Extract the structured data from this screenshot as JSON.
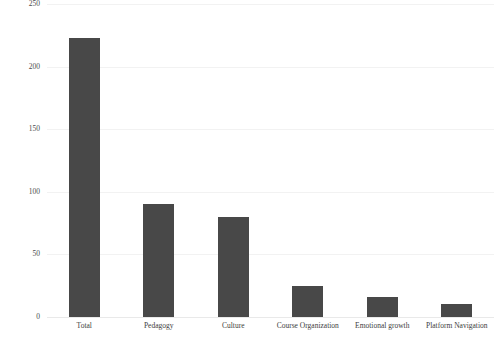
{
  "chart_data": {
    "type": "bar",
    "title": "",
    "subtitle": "",
    "xlabel": "",
    "ylabel": "",
    "categories": [
      "Total",
      "Pedagogy",
      "Culture",
      "Course Organization",
      "Emotional growth",
      "Platform Navigation"
    ],
    "values": [
      223,
      90,
      80,
      25,
      16,
      10
    ],
    "ylim": [
      0,
      250
    ],
    "yticks": [
      0,
      50,
      100,
      150,
      200,
      250
    ],
    "ytick_labels": [
      "0",
      "50",
      "100",
      "150",
      "200",
      "250"
    ],
    "grid": true,
    "grid_axis": "y",
    "legend": false,
    "legend_position": "none",
    "bar_color": "#484848",
    "grid_color": "#f2f2f2",
    "background_color": "#ffffff",
    "axis_text_color": "#3d3d3d"
  }
}
